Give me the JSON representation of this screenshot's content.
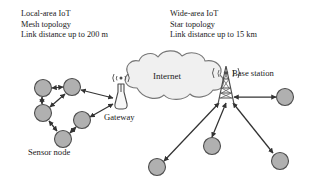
{
  "figure": {
    "type": "network-topology-diagram",
    "background": "#ffffff",
    "width": 311,
    "height": 179
  },
  "colors": {
    "node_fill": "#b0b0b0",
    "node_stroke": "#4d4d4d",
    "cloud_fill": "#f0f0f0",
    "cloud_stroke": "#777777",
    "arrow": "#333333",
    "text": "#1a1a1a",
    "tower_stroke": "#4d4d4d"
  },
  "local_caption": {
    "line1": "Local-area IoT",
    "line2": "Mesh topology",
    "line3": "Link distance up to 200 m"
  },
  "wide_caption": {
    "line1": "Wide-area IoT",
    "line2": "Star topology",
    "line3": "Link distance up to 15 km"
  },
  "labels": {
    "internet": "Internet",
    "gateway": "Gateway",
    "sensor_node": "Sensor node",
    "base_station": "Base station"
  },
  "icons": {
    "gateway": "antenna-gateway-icon",
    "base_station": "cell-tower-icon",
    "cloud": "cloud-icon",
    "node": "sensor-node-icon"
  },
  "mesh_nodes": [
    {
      "id": "m1",
      "cx": 43,
      "cy": 88,
      "r": 8.5
    },
    {
      "id": "m2",
      "cx": 72,
      "cy": 87,
      "r": 8.5
    },
    {
      "id": "m3",
      "cx": 43,
      "cy": 113,
      "r": 8.5
    },
    {
      "id": "m4",
      "cx": 82,
      "cy": 120,
      "r": 8.5
    },
    {
      "id": "m5",
      "cx": 63,
      "cy": 139,
      "r": 8.5
    }
  ],
  "mesh_links": [
    {
      "from": "m1",
      "to": "m2"
    },
    {
      "from": "m1",
      "to": "m3"
    },
    {
      "from": "m3",
      "to": "m2"
    },
    {
      "from": "m2",
      "to": "gateway"
    },
    {
      "from": "m4",
      "to": "gateway"
    },
    {
      "from": "m3",
      "to": "m5"
    },
    {
      "from": "m5",
      "to": "m4"
    }
  ],
  "gateway": {
    "x": 121,
    "y": 92,
    "radio_glyph": "((•))"
  },
  "base_station": {
    "x": 226,
    "y": 94
  },
  "star_nodes": [
    {
      "id": "s1",
      "cx": 285,
      "cy": 97,
      "r": 8.5
    },
    {
      "id": "s2",
      "cx": 212,
      "cy": 146,
      "r": 8.5
    },
    {
      "id": "s3",
      "cx": 280,
      "cy": 161,
      "r": 8.5
    },
    {
      "id": "s4",
      "cx": 157,
      "cy": 167,
      "r": 8.5
    }
  ],
  "star_links": [
    {
      "from": "base_station",
      "to": "s1"
    },
    {
      "from": "base_station",
      "to": "s2"
    },
    {
      "from": "base_station",
      "to": "s3"
    },
    {
      "from": "base_station",
      "to": "s4"
    }
  ],
  "cloud": {
    "cx": 173,
    "cy": 78,
    "rx": 51,
    "ry": 22
  }
}
